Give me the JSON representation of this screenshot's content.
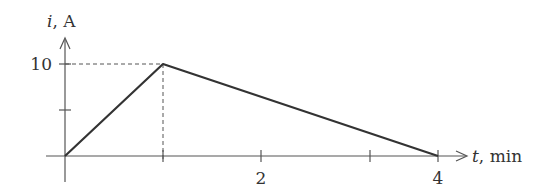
{
  "chart_data": {
    "type": "line",
    "title": "",
    "xlabel": "t, min",
    "xlabel_var": "t",
    "xlabel_unit": ", min",
    "ylabel": "i, A",
    "ylabel_var": "i",
    "ylabel_unit": ", A",
    "x": [
      0,
      1,
      4
    ],
    "y": [
      0,
      10,
      0
    ],
    "series": [
      {
        "name": "i(t)",
        "x": [
          0,
          1,
          4
        ],
        "values": [
          0,
          10,
          0
        ]
      }
    ],
    "x_ticks": [
      1,
      2,
      3,
      4
    ],
    "x_tick_labels": {
      "2": "2",
      "4": "4"
    },
    "y_ticks": [
      5,
      10
    ],
    "y_tick_labels": {
      "10": "10"
    },
    "xlim": [
      0,
      4
    ],
    "ylim": [
      0,
      10
    ],
    "grid": false,
    "legend": "none",
    "annotations": [
      "dashed guide lines from peak (1, 10) to both axes"
    ]
  },
  "colors": {
    "curve": "#333333",
    "axis": "#555555",
    "guide": "#555555"
  }
}
